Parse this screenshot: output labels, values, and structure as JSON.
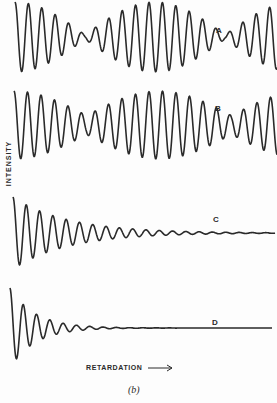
{
  "figure": {
    "caption": "(b)",
    "y_axis_label": "INTENSITY",
    "x_axis_label": "RETARDATION",
    "x_axis_arrow": "→"
  },
  "chart_data": {
    "type": "line",
    "title": "",
    "xlabel": "RETARDATION →",
    "ylabel": "INTENSITY",
    "grid": false,
    "legend": "none (traces labeled inline A, B, C, D)",
    "caption": "(b)",
    "series": [
      {
        "name": "A",
        "description": "Beating cosine interferogram (two close frequencies, equal amplitude) — envelope nearly reaches zero at beat nodes",
        "x_start": 15,
        "x_end": 277,
        "baseline_y": 37,
        "amplitude": 35,
        "period": 13.4,
        "beat_period": 140,
        "beat_phase_x": 15,
        "node_depth": 0.06,
        "label_pos": [
          216,
          26
        ]
      },
      {
        "name": "B",
        "description": "Beating cosine interferogram (two frequencies, unequal amplitudes) — envelope dips but does not reach zero",
        "x_start": 14,
        "x_end": 277,
        "baseline_y": 125,
        "amplitude": 34,
        "period": 13.5,
        "beat_period": 145,
        "beat_phase_x": 14,
        "node_depth": 0.28,
        "label_pos": [
          215,
          104
        ]
      },
      {
        "name": "C",
        "description": "Damped cosine (broad line) — slow exponential decay",
        "x_start": 13,
        "x_end": 275,
        "baseline_y": 233,
        "amplitude": 36,
        "period": 13.3,
        "decay_length": 55,
        "label_pos": [
          213,
          215
        ]
      },
      {
        "name": "D",
        "description": "Damped cosine (broader line) — fast exponential decay",
        "x_start": 10,
        "x_end": 272,
        "baseline_y": 328,
        "amplitude": 40,
        "period": 13.3,
        "decay_length": 25,
        "label_pos": [
          212,
          318
        ]
      }
    ],
    "colors": {
      "trace": "#2a2a2a",
      "background": "#fdfdfd"
    }
  }
}
